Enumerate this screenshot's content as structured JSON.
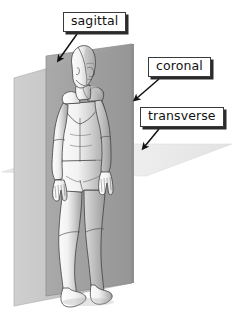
{
  "figure": {
    "type": "anatomical-planes-diagram",
    "background_color": "#ffffff",
    "plane_colors": {
      "sagittal": "#9e9e9e",
      "coronal": "#c6c6c6",
      "transverse": "#ebebeb",
      "body": "#efefef",
      "body_shadow": "#9a9a9a",
      "outline": "#2b2b2b"
    }
  },
  "labels": [
    {
      "id": "sagittal",
      "text": "sagittal",
      "box": {
        "x": 63,
        "y": 12,
        "w": 63,
        "h": 20
      },
      "arrow": {
        "from_x": 76,
        "from_y": 34,
        "to_x": 59,
        "to_y": 59
      },
      "points_to": "sagittal-plane"
    },
    {
      "id": "coronal",
      "text": "coronal",
      "box": {
        "x": 148,
        "y": 57,
        "w": 60,
        "h": 20
      },
      "arrow": {
        "from_x": 158,
        "from_y": 79,
        "to_x": 136,
        "to_y": 99
      },
      "points_to": "coronal-plane"
    },
    {
      "id": "transverse",
      "text": "transverse",
      "box": {
        "x": 140,
        "y": 107,
        "w": 76,
        "h": 20
      },
      "arrow": {
        "from_x": 158,
        "from_y": 129,
        "to_x": 144,
        "to_y": 147
      },
      "points_to": "transverse-plane"
    }
  ],
  "planes": {
    "sagittal": {
      "name": "sagittal plane",
      "orientation": "vertical, divides left and right"
    },
    "coronal": {
      "name": "coronal plane",
      "orientation": "vertical, divides front and back"
    },
    "transverse": {
      "name": "transverse plane",
      "orientation": "horizontal, divides top and bottom"
    }
  }
}
